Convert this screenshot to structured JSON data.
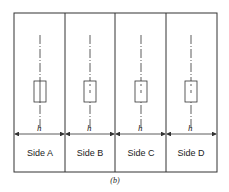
{
  "figure": {
    "caption": "(b)",
    "dimension_label": "h",
    "panels": [
      {
        "label": "Side A"
      },
      {
        "label": "Side B"
      },
      {
        "label": "Side C"
      },
      {
        "label": "Side D"
      }
    ],
    "colors": {
      "line": "#333333",
      "background": "#ffffff"
    }
  }
}
